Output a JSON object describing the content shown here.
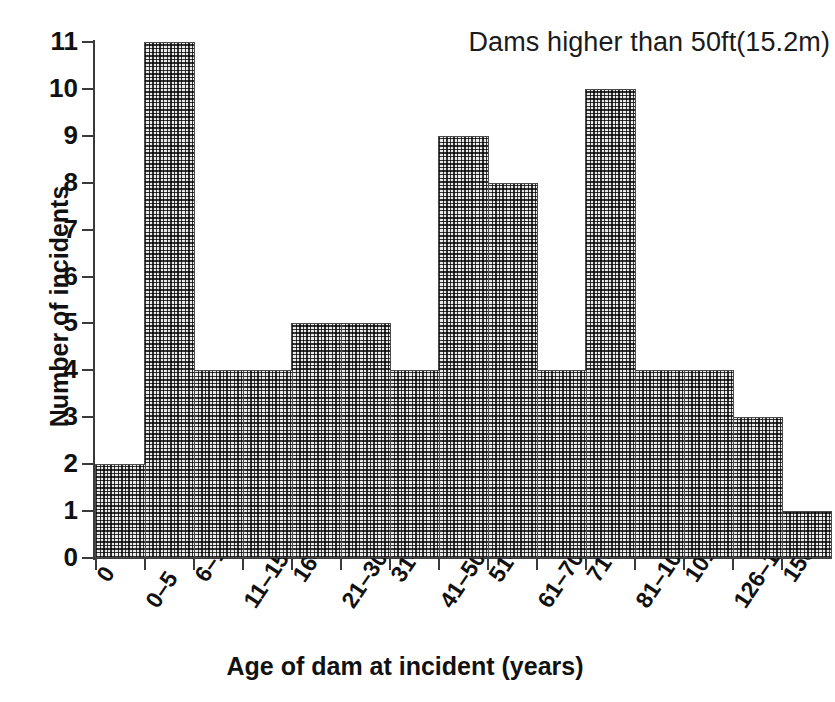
{
  "chart_data": {
    "type": "bar",
    "title": "Dams higher than 50ft(15.2m)",
    "xlabel": "Age of dam at incident (years)",
    "ylabel": "Number of incidents",
    "categories": [
      "0",
      "0–5",
      "6–10",
      "11–15",
      "16–20",
      "21–30",
      "31–40",
      "41–50",
      "51–60",
      "61–70",
      "71–80",
      "81–100",
      "101–125",
      "126–150",
      "150"
    ],
    "values": [
      2,
      11,
      4,
      4,
      5,
      5,
      4,
      9,
      8,
      4,
      10,
      4,
      4,
      3,
      1
    ],
    "ylim": [
      0,
      11
    ],
    "xlim": [
      0,
      15
    ],
    "yticks": [
      0,
      1,
      2,
      3,
      4,
      5,
      6,
      7,
      8,
      9,
      10,
      11
    ],
    "ytick_labels": [
      "0",
      "1",
      "2",
      "3",
      "4",
      "5",
      "6",
      "7",
      "8",
      "9",
      "10",
      "11"
    ],
    "grid": false,
    "legend": null,
    "bar_fill_color": "#e9e9e9",
    "bar_edge_color": "#4a4a4a",
    "axis_color": "#3a3a3a",
    "text_color": "#111111"
  }
}
